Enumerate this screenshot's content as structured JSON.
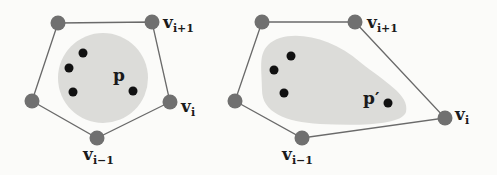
{
  "left": {
    "region_label": "p",
    "vertex_labels": {
      "v_next": "v",
      "v_next_sub": "i+1",
      "v_cur": "v",
      "v_cur_sub": "i",
      "v_prev": "v",
      "v_prev_sub": "i−1"
    }
  },
  "right": {
    "region_label": "p′",
    "vertex_labels": {
      "v_next": "v",
      "v_next_sub": "i+1",
      "v_cur": "v",
      "v_cur_sub": "i",
      "v_prev": "v",
      "v_prev_sub": "i−1"
    }
  },
  "colors": {
    "vertex": "#707070",
    "edge": "#6a6a6a",
    "region": "#d9d9d6",
    "point": "#111111"
  }
}
